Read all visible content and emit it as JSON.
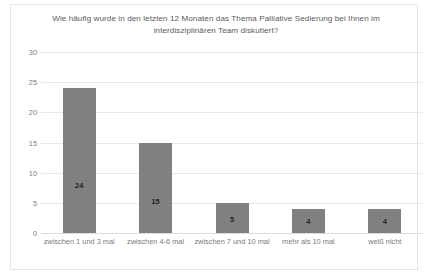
{
  "chart_data": {
    "type": "bar",
    "title": "Wie häufig wurde in den letzten 12 Monaten das Thema Palliative Sedierung bei Ihnen im interdisziplinären Team diskutiert?",
    "categories": [
      "zwischen 1 und 3 mal",
      "zwischen 4-6 mal",
      "zwischen 7 und 10 mal",
      "mehr als 10 mal",
      "weiß nicht"
    ],
    "values": [
      24,
      15,
      5,
      4,
      4
    ],
    "value_labels": [
      "24",
      "15",
      "5",
      "4",
      "4"
    ],
    "xlabel": "",
    "ylabel": "",
    "ylim": [
      0,
      30
    ],
    "ytick_labels": [
      "0",
      "5",
      "10",
      "15",
      "20",
      "25",
      "30"
    ],
    "ytick_values": [
      0,
      5,
      10,
      15,
      20,
      25,
      30
    ],
    "grid": true,
    "legend": false,
    "bar_color": "#808080",
    "gridline_color": "#e8e8e8",
    "title_color": "#5a5a5a",
    "tick_color": "#7a7a7a",
    "value_label_color": "#1f1f1f",
    "border_color": "#e4e4e4",
    "background_color": "#ffffff"
  }
}
